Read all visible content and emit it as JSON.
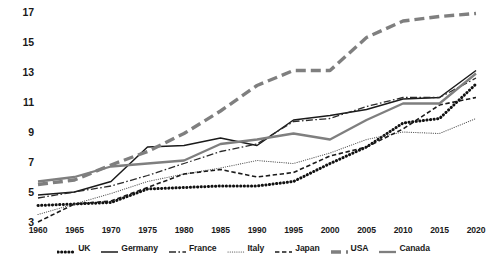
{
  "chart_data": {
    "type": "line",
    "title": "",
    "xlabel": "",
    "ylabel": "",
    "xlim": [
      1960,
      2020
    ],
    "ylim": [
      3,
      17
    ],
    "grid": false,
    "legend_position": "bottom",
    "x": [
      1960,
      1965,
      1970,
      1975,
      1980,
      1985,
      1990,
      1995,
      2000,
      2005,
      2010,
      2015,
      2020
    ],
    "xtick_labels": [
      "1960",
      "1965",
      "1970",
      "1975",
      "1980",
      "1985",
      "1990",
      "1995",
      "2000",
      "2005",
      "2010",
      "2015",
      "2020"
    ],
    "ytick_labels": [
      "3",
      "5",
      "7",
      "9",
      "11",
      "13",
      "15",
      "17"
    ],
    "ytick_values": [
      3,
      5,
      7,
      9,
      11,
      13,
      15,
      17
    ],
    "series": [
      {
        "name": "UK",
        "style": "dotted-thick",
        "color": "#111111",
        "values": [
          4.1,
          4.2,
          4.3,
          5.2,
          5.3,
          5.4,
          5.4,
          5.7,
          6.9,
          8.0,
          9.6,
          9.9,
          12.2
        ]
      },
      {
        "name": "Germany",
        "style": "solid",
        "color": "#1a1a1a",
        "values": [
          4.8,
          5.0,
          5.7,
          8.0,
          8.1,
          8.6,
          8.1,
          9.8,
          10.1,
          10.5,
          11.2,
          11.3,
          13.1
        ]
      },
      {
        "name": "France",
        "style": "dash-dot",
        "color": "#2a2a2a",
        "values": [
          4.6,
          5.0,
          5.4,
          6.1,
          6.9,
          7.7,
          8.2,
          9.7,
          9.9,
          10.7,
          11.3,
          11.3,
          12.6
        ]
      },
      {
        "name": "Italy",
        "style": "fine-dotted",
        "color": "#555555",
        "values": [
          3.5,
          4.2,
          4.9,
          5.7,
          6.2,
          6.6,
          7.1,
          6.9,
          7.6,
          8.5,
          9.0,
          8.9,
          9.9
        ]
      },
      {
        "name": "Japan",
        "style": "dashed",
        "color": "#1a1a1a",
        "values": [
          3.0,
          4.2,
          4.4,
          5.3,
          6.2,
          6.5,
          6.0,
          6.3,
          7.4,
          8.0,
          9.2,
          10.8,
          11.3
        ]
      },
      {
        "name": "USA",
        "style": "long-dash-thick",
        "color": "#7f7f7f",
        "values": [
          5.5,
          5.8,
          6.8,
          7.7,
          8.9,
          10.4,
          12.1,
          13.1,
          13.1,
          15.3,
          16.4,
          16.7,
          16.9
        ]
      },
      {
        "name": "Canada",
        "style": "solid-gray",
        "color": "#7f7f7f",
        "values": [
          5.7,
          6.0,
          6.7,
          6.9,
          7.1,
          8.2,
          8.5,
          8.9,
          8.5,
          9.8,
          10.9,
          10.9,
          12.9
        ]
      }
    ]
  },
  "legend": {
    "items": [
      {
        "label": "UK",
        "swatch": "dotted-thick-icon"
      },
      {
        "label": "Germany",
        "swatch": "solid-line-icon"
      },
      {
        "label": "France",
        "swatch": "dash-dot-line-icon"
      },
      {
        "label": "Italy",
        "swatch": "fine-dotted-line-icon"
      },
      {
        "label": "Japan",
        "swatch": "dashed-line-icon"
      },
      {
        "label": "USA",
        "swatch": "long-dash-thick-icon"
      },
      {
        "label": "Canada",
        "swatch": "solid-gray-line-icon"
      }
    ]
  },
  "background": {
    "bleed_text": ""
  }
}
